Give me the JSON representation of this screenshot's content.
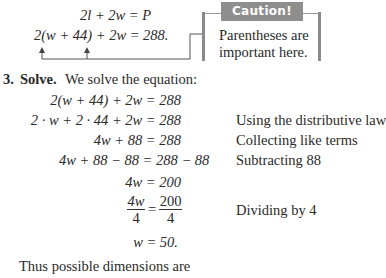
{
  "intro": {
    "eq1": "2l + 2w = P",
    "eq2": "2(w + 44) + 2w = 288."
  },
  "caution": {
    "title": "Caution!",
    "line1": "Parentheses are",
    "line2": "important here.",
    "header_color": "#8e8e8e"
  },
  "step": {
    "number": "3.",
    "label": "Solve.",
    "text": "We solve the equation:"
  },
  "solution": {
    "lines": [
      {
        "lhs": "2(w + 44) + 2w = 288",
        "note": ""
      },
      {
        "lhs": "2 · w + 2 · 44 + 2w = 288",
        "note": "Using the distributive law"
      },
      {
        "lhs": "4w + 88 = 288",
        "note": "Collecting like terms"
      },
      {
        "lhs": "4w + 88 − 88 = 288 − 88",
        "note": "Subtracting 88"
      },
      {
        "lhs": "4w = 200",
        "note": ""
      },
      {
        "frac_left_num": "4w",
        "frac_left_den": "4",
        "equals": "=",
        "frac_right_num": "200",
        "frac_right_den": "4",
        "note": "Dividing by 4"
      },
      {
        "lhs": "w = 50.",
        "note": ""
      }
    ]
  },
  "conclusion": "Thus possible dimensions are"
}
